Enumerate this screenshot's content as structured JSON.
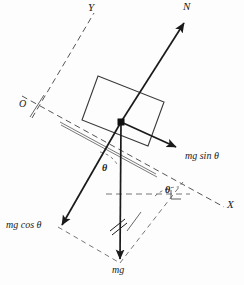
{
  "figure": {
    "type": "free-body-diagram",
    "background_color": "#fdfdfd",
    "stroke_color": "#1a1a1a",
    "dash_color": "#555555"
  },
  "axes": {
    "origin_label": "O",
    "x_label": "X",
    "y_label": "Y",
    "x_axis": {
      "x1": 22,
      "y1": 96,
      "x2": 224,
      "y2": 207
    },
    "y_axis": {
      "x1": 32,
      "y1": 118,
      "x2": 94,
      "y2": 13
    },
    "origin_point": {
      "x": 37,
      "y": 106
    },
    "x_label_pos": {
      "x": 227,
      "y": 206
    },
    "y_label_pos": {
      "x": 88,
      "y": 4
    },
    "origin_label_pos": {
      "x": 19,
      "y": 100
    }
  },
  "block": {
    "name": "block",
    "corners": [
      {
        "x": 98,
        "y": 76
      },
      {
        "x": 164,
        "y": 102
      },
      {
        "x": 148,
        "y": 146
      },
      {
        "x": 82,
        "y": 120
      }
    ],
    "incline_surface": {
      "x1": 60,
      "y1": 122,
      "x2": 156,
      "y2": 174
    }
  },
  "application_point": {
    "x": 121,
    "y": 122
  },
  "forces": [
    {
      "id": "normal",
      "label": "N",
      "label_pos": {
        "x": 184,
        "y": 5
      },
      "tail": {
        "x": 121,
        "y": 122
      },
      "head": {
        "x": 186,
        "y": 20
      }
    },
    {
      "id": "mg-sin-theta",
      "label": "mg sin θ",
      "label_pos": {
        "x": 185,
        "y": 150
      },
      "tail": {
        "x": 121,
        "y": 122
      },
      "head": {
        "x": 180,
        "y": 150
      }
    },
    {
      "id": "mg-cos-theta",
      "label": "mg cos θ",
      "label_pos": {
        "x": 7,
        "y": 220
      },
      "tail": {
        "x": 121,
        "y": 122
      },
      "head": {
        "x": 58,
        "y": 227
      }
    },
    {
      "id": "mg-weight",
      "label": "mg",
      "label_pos": {
        "x": 113,
        "y": 266
      },
      "tail": {
        "x": 121,
        "y": 122
      },
      "head": {
        "x": 120,
        "y": 263
      }
    }
  ],
  "angles": [
    {
      "id": "theta-incline",
      "label": "θ",
      "label_pos": {
        "x": 103,
        "y": 165
      },
      "arc": "M 100 152 A 26 26 0 0 1 117 166"
    },
    {
      "id": "theta-axis",
      "label": "θ",
      "label_pos": {
        "x": 166,
        "y": 188
      },
      "arc": "M 156 196 A 34 34 0 0 1 178 188"
    }
  ],
  "construction_lines": [
    {
      "id": "parallelogram-left",
      "x1": 58,
      "y1": 227,
      "x2": 120,
      "y2": 263
    },
    {
      "id": "parallelogram-right",
      "x1": 120,
      "y1": 263,
      "x2": 183,
      "y2": 182
    },
    {
      "id": "horizontal-guide",
      "x1": 106,
      "y1": 194,
      "x2": 190,
      "y2": 194
    }
  ],
  "tick_marks": {
    "id": "parallel-hash-marks",
    "description": "double slash marks indicating equal/parallel segments on the weight vector",
    "marks": [
      {
        "x1": 110,
        "y1": 230,
        "x2": 125,
        "y2": 218
      },
      {
        "x1": 113,
        "y1": 234,
        "x2": 128,
        "y2": 222
      },
      {
        "x1": 126,
        "y1": 230,
        "x2": 141,
        "y2": 212
      }
    ]
  },
  "right_angle_marker": {
    "x": 171,
    "y": 192,
    "size": 8
  }
}
